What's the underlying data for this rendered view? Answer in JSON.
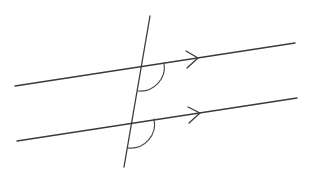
{
  "diagram": {
    "title": "",
    "canvas": {
      "width": 309,
      "height": 173,
      "background": "#ffffff"
    },
    "colors": {
      "line": "#3a3a3a",
      "arc": "#4a4a4a"
    },
    "stroke_width": 1.3,
    "parallel_lines": [
      {
        "id": "upper",
        "x1": 15,
        "y1": 86,
        "x2": 295,
        "y2": 43,
        "arrow": {
          "tip": [
            198,
            58
          ],
          "wing1": [
            186,
            51
          ],
          "wing2": [
            187,
            68
          ]
        }
      },
      {
        "id": "lower",
        "x1": 17,
        "y1": 141,
        "x2": 297,
        "y2": 98,
        "arrow": {
          "tip": [
            200,
            113
          ],
          "wing1": [
            188,
            107
          ],
          "wing2": [
            189,
            123
          ]
        }
      }
    ],
    "transversal": {
      "x1": 150,
      "y1": 16,
      "x2": 124,
      "y2": 167
    },
    "angle_marks": [
      {
        "id": "upper-angle",
        "vertex": [
          141,
          67
        ],
        "start": [
          164,
          63
        ],
        "end": [
          138,
          91
        ],
        "radius": 24
      },
      {
        "id": "lower-angle",
        "vertex": [
          131,
          123
        ],
        "start": [
          154,
          119
        ],
        "end": [
          128,
          148
        ],
        "radius": 24
      }
    ]
  }
}
